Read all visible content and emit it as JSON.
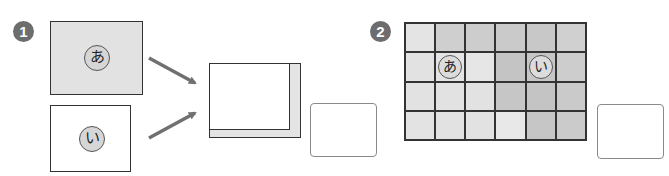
{
  "problem1": {
    "badge": "1",
    "box_a": {
      "marker": "あ",
      "fill": "#e2e2e2"
    },
    "box_i": {
      "marker": "い",
      "fill": "#ffffff"
    },
    "result_box": {
      "inner_fill": "#ffffff",
      "shadow_fill": "#e4e4e4"
    },
    "answer_box": {
      "value": ""
    }
  },
  "problem2": {
    "badge": "2",
    "grid": {
      "rows": 4,
      "cols": 6,
      "cells": [
        [
          "#e4e4e4",
          "#cfcfcf",
          "#cdcdcd",
          "#cacaca",
          "#c8c8c8",
          "#d0d0d0"
        ],
        [
          "#e2e2e2",
          "#e4e4e4",
          "#e6e6e6",
          "#c4c4c4",
          "#c6c6c6",
          "#cdcdcd"
        ],
        [
          "#e2e2e2",
          "#e2e2e2",
          "#e2e2e2",
          "#c6c6c6",
          "#c4c4c4",
          "#cacaca"
        ],
        [
          "#e3e3e3",
          "#e2e2e2",
          "#e2e2e2",
          "#e8e8e8",
          "#c6c6c6",
          "#cbcbcb"
        ]
      ],
      "markers": [
        {
          "row": 1,
          "col": 1,
          "label": "あ"
        },
        {
          "row": 1,
          "col": 4,
          "label": "い"
        }
      ]
    },
    "answer_box": {
      "value": ""
    }
  },
  "colors": {
    "badge": "#6d6d6d",
    "arrow": "#707070",
    "border": "#333333"
  }
}
